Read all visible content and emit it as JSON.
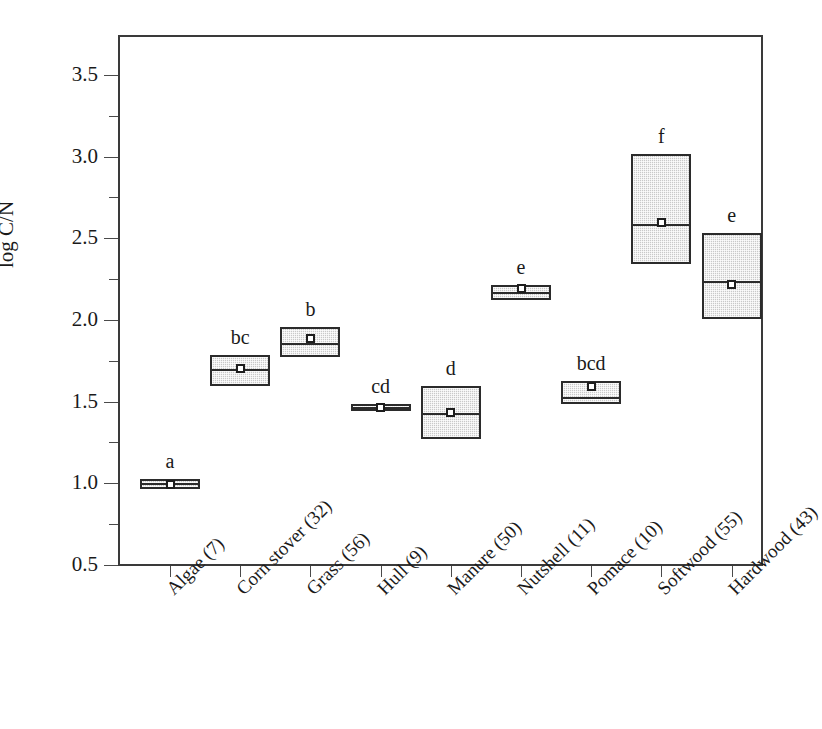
{
  "chart_data": {
    "type": "box",
    "title": "",
    "xlabel": "",
    "ylabel": "log C/N",
    "ylim": [
      0.5,
      3.75
    ],
    "yticks": [
      "0.5",
      "1.0",
      "1.5",
      "2.0",
      "2.5",
      "3.0",
      "3.5"
    ],
    "ytick_values": [
      0.5,
      1.0,
      1.5,
      2.0,
      2.5,
      3.0,
      3.5
    ],
    "minor_ticks": [
      0.75,
      1.25,
      1.75,
      2.25,
      2.75,
      3.25
    ],
    "grid": false,
    "legend": "none",
    "categories": [
      "Algae (7)",
      "Corn stover (32)",
      "Grass (56)",
      "Hull (9)",
      "Manure (50)",
      "Nutshell (11)",
      "Pomace (10)",
      "Softwood (55)",
      "Hardwood (43)"
    ],
    "boxes": [
      {
        "category": "Algae (7)",
        "n": 7,
        "lower": 0.97,
        "median": 1.0,
        "upper": 1.03,
        "mean": 1.0,
        "letter": "a"
      },
      {
        "category": "Corn stover (32)",
        "n": 32,
        "lower": 1.6,
        "median": 1.7,
        "upper": 1.79,
        "mean": 1.71,
        "letter": "bc"
      },
      {
        "category": "Grass (56)",
        "n": 56,
        "lower": 1.78,
        "median": 1.86,
        "upper": 1.96,
        "mean": 1.89,
        "letter": "b"
      },
      {
        "category": "Hull (9)",
        "n": 9,
        "lower": 1.45,
        "median": 1.47,
        "upper": 1.49,
        "mean": 1.47,
        "letter": "cd"
      },
      {
        "category": "Manure (50)",
        "n": 50,
        "lower": 1.28,
        "median": 1.43,
        "upper": 1.6,
        "mean": 1.44,
        "letter": "d"
      },
      {
        "category": "Nutshell (11)",
        "n": 11,
        "lower": 2.13,
        "median": 2.17,
        "upper": 2.22,
        "mean": 2.2,
        "letter": "e"
      },
      {
        "category": "Pomace (10)",
        "n": 10,
        "lower": 1.49,
        "median": 1.53,
        "upper": 1.63,
        "mean": 1.6,
        "letter": "bcd"
      },
      {
        "category": "Softwood (55)",
        "n": 55,
        "lower": 2.35,
        "median": 2.59,
        "upper": 3.02,
        "mean": 2.6,
        "letter": "f"
      },
      {
        "category": "Hardwood (43)",
        "n": 43,
        "lower": 2.01,
        "median": 2.24,
        "upper": 2.54,
        "mean": 2.22,
        "letter": "e"
      }
    ],
    "colors": {
      "box_fill": "#c9c9c9",
      "box_edge": "#2b2b2b",
      "axis": "#3a3a3a",
      "background": "#ffffff",
      "text": "#1a1a1a"
    }
  }
}
